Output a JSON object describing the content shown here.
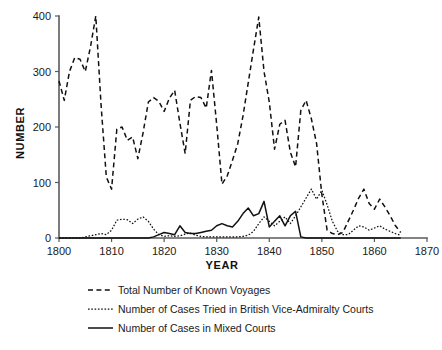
{
  "chart_data": {
    "type": "line",
    "title": "",
    "xlabel": "YEAR",
    "ylabel": "NUMBER",
    "xlim": [
      1800,
      1870
    ],
    "ylim": [
      0,
      400
    ],
    "xticks": [
      1800,
      1810,
      1820,
      1830,
      1840,
      1850,
      1860,
      1870
    ],
    "yticks": [
      0,
      100,
      200,
      300,
      400
    ],
    "grid": false,
    "legend_position": "below-plot",
    "series": [
      {
        "name": "Total Number of Known Voyages",
        "style": "dashed",
        "color": "#111111",
        "x": [
          1800,
          1801,
          1802,
          1803,
          1804,
          1805,
          1806,
          1807,
          1808,
          1809,
          1810,
          1811,
          1812,
          1813,
          1814,
          1815,
          1816,
          1817,
          1818,
          1819,
          1820,
          1821,
          1822,
          1823,
          1824,
          1825,
          1826,
          1827,
          1828,
          1829,
          1830,
          1831,
          1832,
          1833,
          1834,
          1835,
          1836,
          1837,
          1838,
          1839,
          1840,
          1841,
          1842,
          1843,
          1844,
          1845,
          1846,
          1847,
          1848,
          1849,
          1850,
          1851,
          1852,
          1853,
          1854,
          1855,
          1856,
          1857,
          1858,
          1859,
          1860,
          1861,
          1862,
          1863,
          1864,
          1865
        ],
        "y": [
          283,
          248,
          300,
          325,
          322,
          300,
          345,
          400,
          240,
          110,
          88,
          196,
          200,
          176,
          182,
          143,
          190,
          245,
          253,
          246,
          228,
          252,
          266,
          207,
          152,
          248,
          255,
          253,
          234,
          302,
          204,
          97,
          112,
          140,
          170,
          220,
          280,
          340,
          398,
          300,
          245,
          160,
          205,
          212,
          155,
          128,
          230,
          248,
          215,
          170,
          78,
          14,
          8,
          6,
          10,
          30,
          50,
          72,
          88,
          62,
          52,
          70,
          56,
          40,
          22,
          10
        ]
      },
      {
        "name": "Number of Cases Tried in British Vice-Admiralty Courts",
        "style": "dotted",
        "color": "#111111",
        "x": [
          1800,
          1801,
          1802,
          1803,
          1804,
          1805,
          1806,
          1807,
          1808,
          1809,
          1810,
          1811,
          1812,
          1813,
          1814,
          1815,
          1816,
          1817,
          1818,
          1819,
          1820,
          1821,
          1822,
          1823,
          1824,
          1825,
          1826,
          1827,
          1828,
          1829,
          1830,
          1831,
          1832,
          1833,
          1834,
          1835,
          1836,
          1837,
          1838,
          1839,
          1840,
          1841,
          1842,
          1843,
          1844,
          1845,
          1846,
          1847,
          1848,
          1849,
          1850,
          1851,
          1852,
          1853,
          1854,
          1855,
          1856,
          1857,
          1858,
          1859,
          1860,
          1861,
          1862,
          1863,
          1864,
          1865
        ],
        "y": [
          0,
          0,
          0,
          0,
          0,
          2,
          4,
          6,
          8,
          6,
          14,
          32,
          34,
          33,
          26,
          34,
          38,
          30,
          16,
          6,
          3,
          4,
          3,
          4,
          7,
          9,
          5,
          3,
          2,
          2,
          2,
          2,
          2,
          2,
          2,
          3,
          5,
          12,
          26,
          38,
          30,
          22,
          30,
          38,
          26,
          40,
          56,
          72,
          88,
          70,
          86,
          60,
          30,
          12,
          6,
          6,
          14,
          22,
          20,
          14,
          18,
          22,
          16,
          12,
          8,
          5
        ]
      },
      {
        "name": "Number of Cases in Mixed Courts",
        "style": "solid",
        "color": "#111111",
        "x": [
          1800,
          1801,
          1802,
          1803,
          1804,
          1805,
          1806,
          1807,
          1808,
          1809,
          1810,
          1811,
          1812,
          1813,
          1814,
          1815,
          1816,
          1817,
          1818,
          1819,
          1820,
          1821,
          1822,
          1823,
          1824,
          1825,
          1826,
          1827,
          1828,
          1829,
          1830,
          1831,
          1832,
          1833,
          1834,
          1835,
          1836,
          1837,
          1838,
          1839,
          1840,
          1841,
          1842,
          1843,
          1844,
          1845,
          1846,
          1847,
          1848,
          1849,
          1850,
          1851,
          1852,
          1853,
          1854,
          1855,
          1856,
          1857,
          1858,
          1859,
          1860,
          1861,
          1862,
          1863,
          1864,
          1865
        ],
        "y": [
          0,
          0,
          0,
          0,
          0,
          0,
          0,
          0,
          0,
          0,
          0,
          0,
          0,
          0,
          0,
          0,
          0,
          0,
          2,
          6,
          10,
          8,
          6,
          22,
          10,
          8,
          8,
          10,
          12,
          14,
          22,
          26,
          22,
          20,
          30,
          44,
          54,
          40,
          44,
          66,
          20,
          30,
          40,
          22,
          40,
          48,
          2,
          0,
          0,
          0,
          0,
          0,
          0,
          0,
          0,
          0,
          0,
          0,
          0,
          0,
          0,
          0,
          0,
          0,
          0,
          0
        ]
      }
    ]
  },
  "legend": {
    "items": [
      {
        "label": "Total Number of Known Voyages",
        "style": "dashed"
      },
      {
        "label": "Number of Cases Tried in British Vice-Admiralty Courts",
        "style": "dotted"
      },
      {
        "label": "Number of Cases in Mixed Courts",
        "style": "solid"
      }
    ]
  }
}
